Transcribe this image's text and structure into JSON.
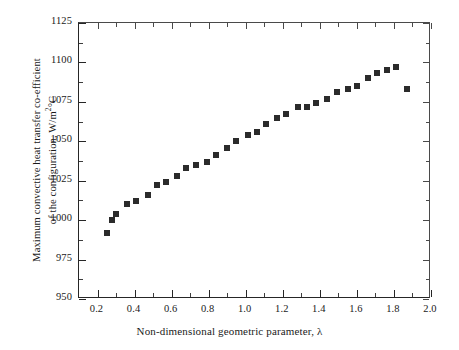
{
  "chart_data": {
    "type": "scatter",
    "title": "",
    "xlabel": "Non-dimensional geometric parameter, λ",
    "ylabel_line1": "Maximum convective heat transfer co-efficient",
    "ylabel_line2_pre": "of the configuration, W/m",
    "ylabel_line2_sup": "2",
    "ylabel_line2_post": "°C",
    "ylabel_full": "Maximum convective heat transfer co-efficient of the configuration, W/m2°C",
    "xlim": [
      0.1,
      2.0
    ],
    "ylim": [
      950,
      1125
    ],
    "x_ticks": [
      0.2,
      0.4,
      0.6,
      0.8,
      1.0,
      1.2,
      1.4,
      1.6,
      1.8,
      2.0
    ],
    "x_tick_labels": [
      "0.2",
      "0.4",
      "0.6",
      "0.8",
      "1.0",
      "1.2",
      "1.4",
      "1.6",
      "1.8",
      "2.0"
    ],
    "x_minor_ticks": [
      0.3,
      0.5,
      0.7,
      0.9,
      1.1,
      1.3,
      1.5,
      1.7,
      1.9
    ],
    "y_ticks": [
      950,
      975,
      1000,
      1025,
      1050,
      1075,
      1100,
      1125
    ],
    "y_tick_labels": [
      "950",
      "975",
      "1000",
      "1025",
      "1050",
      "1075",
      "1100",
      "1125"
    ],
    "y_minor_ticks": [
      962.5,
      987.5,
      1012.5,
      1037.5,
      1062.5,
      1087.5,
      1112.5
    ],
    "grid": false,
    "legend": null,
    "marker": "square",
    "marker_color": "#2b2b2b",
    "marker_size_px": 6,
    "x": [
      0.25,
      0.28,
      0.3,
      0.36,
      0.41,
      0.47,
      0.52,
      0.57,
      0.63,
      0.68,
      0.73,
      0.79,
      0.84,
      0.9,
      0.95,
      1.01,
      1.06,
      1.11,
      1.17,
      1.22,
      1.28,
      1.33,
      1.38,
      1.44,
      1.49,
      1.55,
      1.6,
      1.66,
      1.71,
      1.76,
      1.81,
      1.87
    ],
    "y": [
      992,
      1000,
      1004,
      1010,
      1012,
      1016,
      1022,
      1024,
      1028,
      1033,
      1035,
      1037,
      1041,
      1046,
      1050,
      1054,
      1056,
      1061,
      1065,
      1067,
      1072,
      1072,
      1074,
      1077,
      1081,
      1083,
      1085,
      1090,
      1093,
      1095,
      1097,
      1083
    ],
    "series_name": "Maximum convective heat transfer co-efficient",
    "n_points": 32,
    "peak": {
      "x": 1.81,
      "y": 1097
    },
    "minimum": {
      "x": 0.25,
      "y": 992
    }
  },
  "figure": {
    "background_color": "#ffffff",
    "axis_color": "#262626"
  }
}
